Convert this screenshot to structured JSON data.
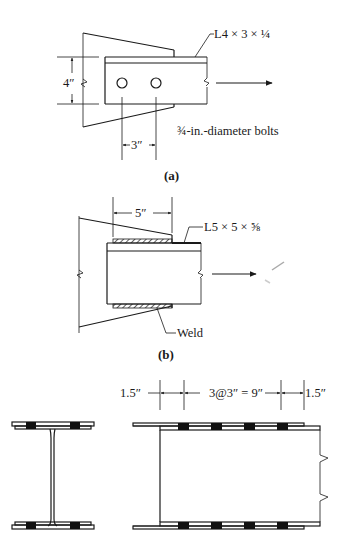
{
  "figure_a": {
    "caption": "(a)",
    "member_label": "L4 × 3 × ¼",
    "bolt_label": "¾-in.-diameter bolts",
    "gage_dimension": "4″",
    "pitch_dimension": "3″",
    "bolt_count": 2
  },
  "figure_b": {
    "caption": "(b)",
    "member_label": "L5 × 5 × ⅝",
    "weld_length_dimension": "5″",
    "weld_label": "Weld"
  },
  "figure_c": {
    "edge_distance_left": "1.5″",
    "spacing_dimension": "3@3″ = 9″",
    "edge_distance_right": "1.5″",
    "bolts_per_row": 4,
    "cross_section_bolts_per_flange": 2
  }
}
